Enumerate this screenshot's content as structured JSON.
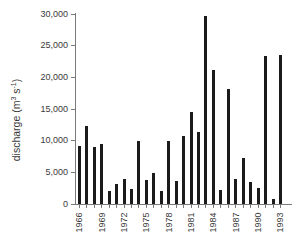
{
  "labels": {
    "ylabel_prefix": "discharge (m",
    "ylabel_sup1": "3",
    "ylabel_mid": " s",
    "ylabel_sup2": "-1",
    "ylabel_suffix": ")"
  },
  "chart_data": {
    "type": "bar",
    "title": "",
    "xlabel": "",
    "ylabel": "discharge (m3 s-1)",
    "x": [
      1966,
      1967,
      1968,
      1969,
      1970,
      1971,
      1972,
      1973,
      1974,
      1975,
      1976,
      1977,
      1978,
      1979,
      1980,
      1981,
      1982,
      1983,
      1984,
      1985,
      1986,
      1987,
      1988,
      1989,
      1990,
      1991,
      1992,
      1993
    ],
    "values": [
      9200,
      12300,
      9000,
      9400,
      2000,
      3200,
      3900,
      2300,
      9900,
      3800,
      4900,
      2000,
      10000,
      3700,
      10700,
      14500,
      11400,
      29700,
      21200,
      2200,
      18100,
      4000,
      7200,
      3500,
      2500,
      23400,
      800,
      23600
    ],
    "ylim": [
      0,
      30000
    ],
    "yticks": [
      0,
      5000,
      10000,
      15000,
      20000,
      25000,
      30000
    ],
    "ytick_labels": [
      "0",
      "5,000",
      "10,000",
      "15,000",
      "20,000",
      "25,000",
      "30,000"
    ],
    "xtick_labels": [
      "1966",
      "1969",
      "1972",
      "1975",
      "1978",
      "1981",
      "1984",
      "1987",
      "1990",
      "1993"
    ],
    "grid": false,
    "legend": null,
    "bar_color": "#1b1b1b",
    "axis_color": "#7a7a7a",
    "text_color": "#3a3a3a",
    "background_color": "#ffffff"
  }
}
